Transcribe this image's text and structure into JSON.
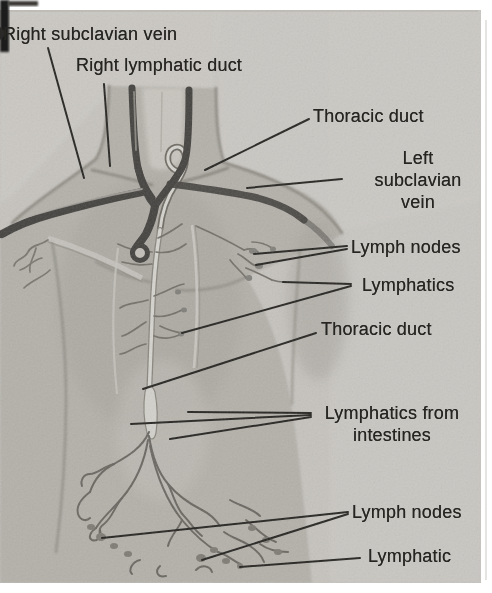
{
  "figure": {
    "kind": "scanned anatomical textbook illustration"
  },
  "colors": {
    "paper": "#ffffff",
    "halftone_bg": "#c6c3be",
    "background_light": "#cbc9c4",
    "body": "#b4b1aa",
    "body_shade": "#9b9890",
    "vein_dark": "#454340",
    "duct_light": "#d6d4ce",
    "vessel_line": "#74716a",
    "ink": "#262522"
  },
  "labels": {
    "right_subclavian_vein": "Right subclavian vein",
    "right_lymphatic_duct": "Right lymphatic duct",
    "thoracic_duct_upper": "Thoracic duct",
    "left_subclavian_vein": [
      "Left",
      "subclavian",
      "vein"
    ],
    "lymph_nodes_upper": "Lymph nodes",
    "lymphatics_upper": "Lymphatics",
    "thoracic_duct_mid": "Thoracic duct",
    "lymphatics_from_intestines": [
      "Lymphatics from",
      "intestines"
    ],
    "lymph_nodes_lower": "Lymph nodes",
    "lymphatic_lower": "Lymphatic"
  }
}
